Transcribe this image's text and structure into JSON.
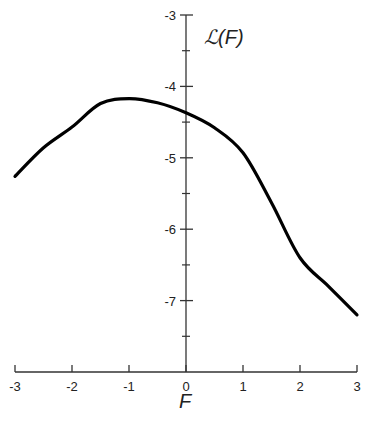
{
  "chart_data": {
    "type": "line",
    "title": "",
    "xlabel": "F",
    "ylabel": "ℒ(F)",
    "xlim": [
      -3,
      3
    ],
    "ylim": [
      -8,
      -3
    ],
    "x_ticks": [
      -3,
      -2,
      -1,
      0,
      1,
      2,
      3
    ],
    "x_tick_labels": [
      "-3",
      "-2",
      "-1",
      "0",
      "1",
      "2",
      "3"
    ],
    "y_ticks": [
      -3,
      -4,
      -5,
      -6,
      -7
    ],
    "y_tick_labels": [
      "-3",
      "-4",
      "-5",
      "-6",
      "-7"
    ],
    "y_minor_ticks": [
      -3.5,
      -4.5,
      -5.5,
      -6.5,
      -7.5
    ],
    "grid": false,
    "legend": null,
    "series": [
      {
        "name": "ℒ(F)",
        "x": [
          -3,
          -2.5,
          -2,
          -1.5,
          -1,
          -0.5,
          0,
          0.5,
          1,
          1.5,
          2,
          2.5,
          3
        ],
        "values": [
          -5.26,
          -4.86,
          -4.57,
          -4.24,
          -4.17,
          -4.23,
          -4.37,
          -4.58,
          -4.93,
          -5.63,
          -6.4,
          -6.8,
          -7.2
        ]
      }
    ]
  },
  "colors": {
    "curve": "#000000",
    "axis": "#333333",
    "text": "#222222",
    "background": "#ffffff"
  }
}
